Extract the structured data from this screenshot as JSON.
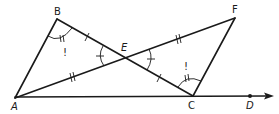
{
  "diagram": {
    "type": "geometry",
    "points": {
      "A": {
        "label": "A",
        "x": 15,
        "y": 98,
        "lx": 11,
        "ly": 110
      },
      "B": {
        "label": "B",
        "x": 57,
        "y": 19,
        "lx": 54,
        "ly": 15
      },
      "C": {
        "label": "C",
        "x": 193,
        "y": 96,
        "lx": 188,
        "ly": 109
      },
      "D": {
        "label": "D",
        "x": 250,
        "y": 96,
        "lx": 246,
        "ly": 109
      },
      "E": {
        "label": "E",
        "x": 125,
        "y": 58,
        "lx": 121,
        "ly": 51
      },
      "F": {
        "label": "F",
        "x": 235,
        "y": 18,
        "lx": 232,
        "ly": 13
      }
    },
    "segments": [
      "AB",
      "BC",
      "AF",
      "FC"
    ],
    "ray": {
      "from": "A",
      "through": "D",
      "end_x": 272,
      "end_y": 96
    },
    "congruence_marks": {
      "single_tick": [
        "BE",
        "EC"
      ],
      "double_tick": [
        "AE",
        "EF"
      ]
    },
    "angle_marks": {
      "single_arc_tick": [
        "BEA",
        "FEC"
      ],
      "double_arc_tick": [
        "ABE",
        "ECF"
      ]
    },
    "annotations": {
      "exclaim_B": "!",
      "exclaim_C": "!"
    },
    "color": "#1a1a1a"
  }
}
